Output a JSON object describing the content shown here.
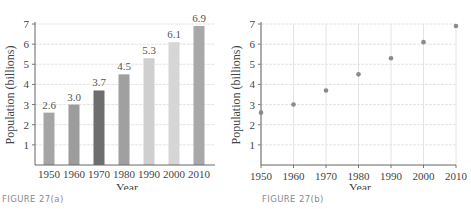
{
  "chart_data": [
    {
      "type": "bar",
      "title": "",
      "caption": "FIGURE 27(a)",
      "xlabel": "Year",
      "ylabel": "Population (billions)",
      "categories": [
        "1950",
        "1960",
        "1970",
        "1980",
        "1990",
        "2000",
        "2010"
      ],
      "values": [
        2.6,
        3.0,
        3.7,
        4.5,
        5.3,
        6.1,
        6.9
      ],
      "data_labels": [
        "2.6",
        "3.0",
        "3.7",
        "4.5",
        "5.3",
        "6.1",
        "6.9"
      ],
      "bar_colors": [
        "#a5a5a5",
        "#9c9c9c",
        "#6e6e6e",
        "#a0a0a0",
        "#cfcfcf",
        "#d6d6d6",
        "#a8a8a8"
      ],
      "ylim": [
        0,
        7
      ],
      "yticks": [
        "1",
        "2",
        "3",
        "4",
        "5",
        "6",
        "7"
      ],
      "grid": true
    },
    {
      "type": "scatter",
      "title": "",
      "caption": "FIGURE 27(b)",
      "xlabel": "Year",
      "ylabel": "Population (billions)",
      "x": [
        1950,
        1960,
        1970,
        1980,
        1990,
        2000,
        2010
      ],
      "y": [
        2.6,
        3.0,
        3.7,
        4.5,
        5.3,
        6.1,
        6.9
      ],
      "xticks": [
        "1950",
        "1960",
        "1970",
        "1980",
        "1990",
        "2000",
        "2010"
      ],
      "yticks": [
        "1",
        "2",
        "3",
        "4",
        "5",
        "6",
        "7"
      ],
      "xlim": [
        1950,
        2010
      ],
      "ylim": [
        0,
        7
      ],
      "marker_color": "#8a8a8a",
      "grid": true
    }
  ]
}
